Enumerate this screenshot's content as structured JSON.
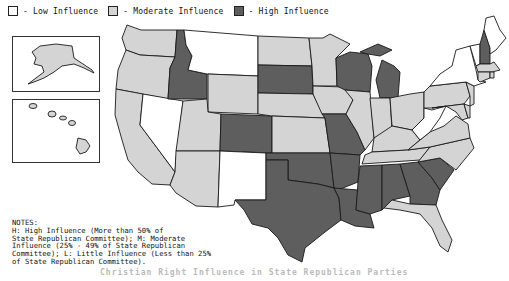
{
  "legend": {
    "items": [
      {
        "key": "low",
        "label": "- Low Influence",
        "color": "#ffffff"
      },
      {
        "key": "moderate",
        "label": "- Moderate Influence",
        "color": "#d4d4d4"
      },
      {
        "key": "high",
        "label": "- High Influence",
        "color": "#5e5e5e"
      }
    ]
  },
  "notes": {
    "heading": "NOTES:",
    "text": "H: High Influence (More than 50% of\nState Republican Committee); M: Moderate\nInfluence (25% - 49% of State Republican\nCommittee); L: Little Influence (Less than 25%\nof State Republican Committee)."
  },
  "caption": "Christian Right Influence in State Republican Parties",
  "map": {
    "colors": {
      "low": "#ffffff",
      "moderate": "#d4d4d4",
      "high": "#5e5e5e"
    },
    "states": {
      "high": [
        "Idaho",
        "South Dakota",
        "Colorado",
        "Wisconsin",
        "Michigan",
        "Missouri",
        "Texas",
        "Oklahoma",
        "Arkansas",
        "Louisiana",
        "Mississippi",
        "Alabama",
        "Georgia",
        "South Carolina",
        "New Hampshire"
      ],
      "low": [
        "Montana",
        "Nevada",
        "New Mexico",
        "New York",
        "Vermont",
        "Maine",
        "West Virginia"
      ],
      "moderate": [
        "Alaska",
        "Hawaii",
        "Washington",
        "Oregon",
        "California",
        "Utah",
        "Arizona",
        "Wyoming",
        "North Dakota",
        "Nebraska",
        "Kansas",
        "Minnesota",
        "Iowa",
        "Illinois",
        "Indiana",
        "Ohio",
        "Kentucky",
        "Tennessee",
        "North Carolina",
        "Virginia",
        "Pennsylvania",
        "New Jersey",
        "Delaware",
        "Maryland",
        "Connecticut",
        "Rhode Island",
        "Massachusetts",
        "Florida"
      ]
    }
  }
}
